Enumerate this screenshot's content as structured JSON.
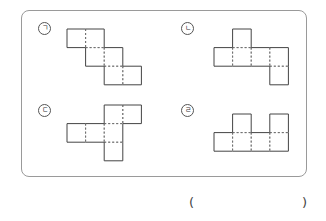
{
  "question": {
    "options": [
      {
        "id": "a",
        "label": "ㄱ",
        "label_pos": [
          38,
          22
        ],
        "cells": [
          [
            0,
            0
          ],
          [
            0,
            1
          ],
          [
            1,
            1
          ],
          [
            1,
            2
          ],
          [
            2,
            2
          ],
          [
            2,
            3
          ]
        ],
        "origin": [
          67,
          29
        ]
      },
      {
        "id": "b",
        "label": "ㄴ",
        "label_pos": [
          181,
          22
        ],
        "cells": [
          [
            0,
            1
          ],
          [
            1,
            0
          ],
          [
            1,
            1
          ],
          [
            1,
            2
          ],
          [
            1,
            3
          ],
          [
            2,
            3
          ]
        ],
        "origin": [
          214,
          29
        ]
      },
      {
        "id": "c",
        "label": "ㄷ",
        "label_pos": [
          38,
          104
        ],
        "cells": [
          [
            0,
            2
          ],
          [
            0,
            3
          ],
          [
            1,
            0
          ],
          [
            1,
            1
          ],
          [
            1,
            2
          ],
          [
            2,
            2
          ]
        ],
        "origin": [
          67,
          105
        ]
      },
      {
        "id": "d",
        "label": "ㄹ",
        "label_pos": [
          181,
          104
        ],
        "cells": [
          [
            0,
            1
          ],
          [
            0,
            3
          ],
          [
            1,
            0
          ],
          [
            1,
            1
          ],
          [
            1,
            2
          ],
          [
            1,
            3
          ]
        ],
        "origin": [
          214,
          114
        ]
      }
    ],
    "cell_size": 18.6,
    "answer_open": "(",
    "answer_close": ")"
  },
  "colors": {
    "solid": "#444444",
    "dashed": "#666666",
    "frame": "#9a9a9a"
  }
}
